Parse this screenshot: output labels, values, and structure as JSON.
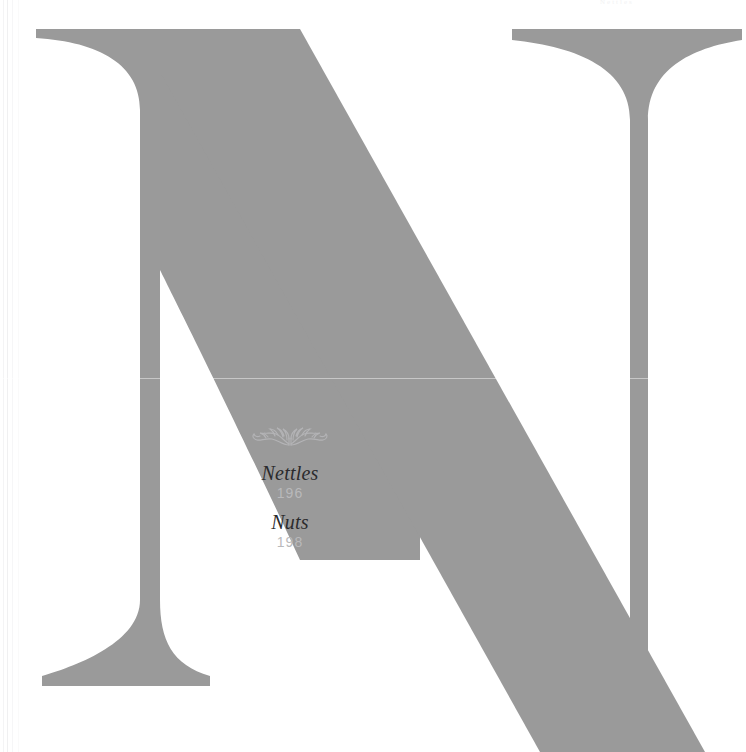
{
  "page": {
    "letter": "N",
    "letter_color": "#9a9a9a",
    "background_color": "#ffffff",
    "header_remnant": "Nettles"
  },
  "ornament": {
    "name": "floral-flourish-ornament",
    "color": "#cfcfd2"
  },
  "contents": {
    "entries": [
      {
        "title": "Nettles",
        "page": "196"
      },
      {
        "title": "Nuts",
        "page": "198"
      }
    ],
    "title_color": "#2b2b2d",
    "page_number_color": "#b9b9bb"
  }
}
